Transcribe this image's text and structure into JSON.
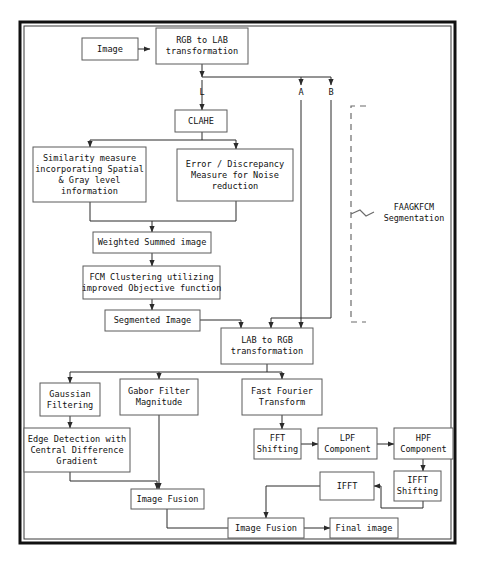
{
  "diagram": {
    "colors": {
      "box_stroke": "#5b5b5b",
      "edge": "#2b2b2b",
      "frame": "#111111",
      "bracket": "#6b6b6b",
      "background": "#ffffff"
    },
    "frame": {
      "x": 20,
      "y": 22,
      "w": 435,
      "h": 521
    },
    "nodes": [
      {
        "id": "image",
        "label": "Image",
        "lines": [
          "Image"
        ],
        "x": 82,
        "y": 38,
        "w": 56,
        "h": 22
      },
      {
        "id": "rgb2lab",
        "label": "RGB to LAB transformation",
        "lines": [
          "RGB to LAB",
          "transformation"
        ],
        "x": 156,
        "y": 28,
        "w": 92,
        "h": 36
      },
      {
        "id": "clahe",
        "label": "CLAHE",
        "lines": [
          "CLAHE"
        ],
        "x": 175,
        "y": 110,
        "w": 52,
        "h": 22
      },
      {
        "id": "similarity",
        "label": "Similarity measure incorporating Spatial & Gray level information",
        "lines": [
          "Similarity measure",
          "incorporating Spatial",
          "& Gray level",
          "information"
        ],
        "x": 33,
        "y": 147,
        "w": 113,
        "h": 55
      },
      {
        "id": "error",
        "label": "Error / Discrepancy Measure for Noise reduction",
        "lines": [
          "Error / Discrepancy",
          "Measure for Noise",
          "reduction"
        ],
        "x": 177,
        "y": 149,
        "w": 116,
        "h": 52
      },
      {
        "id": "weighted",
        "label": "Weighted Summed image",
        "lines": [
          "Weighted Summed image"
        ],
        "x": 93,
        "y": 232,
        "w": 118,
        "h": 21
      },
      {
        "id": "fcm",
        "label": "FCM Clustering utilizing improved Objective function",
        "lines": [
          "FCM Clustering utilizing",
          "improved Objective function"
        ],
        "x": 83,
        "y": 266,
        "w": 137,
        "h": 33
      },
      {
        "id": "segmented",
        "label": "Segmented Image",
        "lines": [
          "Segmented Image"
        ],
        "x": 105,
        "y": 310,
        "w": 95,
        "h": 21
      },
      {
        "id": "lab2rgb",
        "label": "LAB to RGB transformation",
        "lines": [
          "LAB to RGB",
          "transformation"
        ],
        "x": 221,
        "y": 328,
        "w": 92,
        "h": 36
      },
      {
        "id": "gaussian",
        "label": "Gaussian Filtering",
        "lines": [
          "Gaussian",
          "Filtering"
        ],
        "x": 40,
        "y": 383,
        "w": 60,
        "h": 33
      },
      {
        "id": "gabor",
        "label": "Gabor Filter Magnitude",
        "lines": [
          "Gabor Filter",
          "Magnitude"
        ],
        "x": 120,
        "y": 379,
        "w": 78,
        "h": 36
      },
      {
        "id": "fft",
        "label": "Fast Fourier Transform",
        "lines": [
          "Fast Fourier",
          "Transform"
        ],
        "x": 242,
        "y": 379,
        "w": 80,
        "h": 36
      },
      {
        "id": "edge",
        "label": "Edge Detection with Central Difference Gradient",
        "lines": [
          "Edge Detection with",
          "Central Difference",
          "Gradient"
        ],
        "x": 24,
        "y": 428,
        "w": 106,
        "h": 44
      },
      {
        "id": "fftshift",
        "label": "FFT Shifting",
        "lines": [
          "FFT",
          "Shifting"
        ],
        "x": 254,
        "y": 429,
        "w": 47,
        "h": 30
      },
      {
        "id": "lpf",
        "label": "LPF Component",
        "lines": [
          "LPF",
          "Component"
        ],
        "x": 318,
        "y": 428,
        "w": 59,
        "h": 31
      },
      {
        "id": "hpf",
        "label": "HPF Component",
        "lines": [
          "HPF",
          "Component"
        ],
        "x": 394,
        "y": 428,
        "w": 59,
        "h": 31
      },
      {
        "id": "ifftshift",
        "label": "IFFT Shifting",
        "lines": [
          "IFFT",
          "Shifting"
        ],
        "x": 394,
        "y": 471,
        "w": 47,
        "h": 30
      },
      {
        "id": "ifft",
        "label": "IFFT",
        "lines": [
          "IFFT"
        ],
        "x": 320,
        "y": 472,
        "w": 54,
        "h": 28
      },
      {
        "id": "fusion1",
        "label": "Image Fusion",
        "lines": [
          "Image Fusion"
        ],
        "x": 131,
        "y": 489,
        "w": 73,
        "h": 20
      },
      {
        "id": "fusion2",
        "label": "Image Fusion",
        "lines": [
          "Image Fusion"
        ],
        "x": 228,
        "y": 518,
        "w": 76,
        "h": 20
      },
      {
        "id": "final",
        "label": "Final image",
        "lines": [
          "Final image"
        ],
        "x": 330,
        "y": 518,
        "w": 68,
        "h": 20
      }
    ],
    "edge_labels": [
      {
        "id": "label-L",
        "text": "L",
        "x": 202,
        "y": 95
      },
      {
        "id": "label-A",
        "text": "A",
        "x": 301,
        "y": 95
      },
      {
        "id": "label-B",
        "text": "B",
        "x": 331,
        "y": 95
      }
    ],
    "edges": [
      {
        "id": "image-to-rgb2lab",
        "from": "image",
        "to": "rgb2lab",
        "path": "M138,49 L150,49",
        "arrow": true
      },
      {
        "id": "rgb2lab-to-split",
        "from": "rgb2lab",
        "to": "split-bus",
        "path": "M202,64 L202,77",
        "arrow": true
      },
      {
        "id": "split-bus",
        "from": "rgb2lab",
        "to": "ab-bus",
        "path": "M202,77 L331,77",
        "arrow": false
      },
      {
        "id": "bus-to-A",
        "from": "rgb2lab",
        "to": "A",
        "path": "M301,77 L301,85",
        "arrow": true
      },
      {
        "id": "bus-to-B",
        "from": "rgb2lab",
        "to": "B",
        "path": "M331,77 L331,85",
        "arrow": true
      },
      {
        "id": "L-to-clahe",
        "from": "rgb2lab",
        "to": "clahe",
        "path": "M202,80 L202,110",
        "arrow": true
      },
      {
        "id": "clahe-to-branch",
        "from": "clahe",
        "to": "branch",
        "path": "M202,132 L202,140 M90,140 L236,140",
        "arrow": false
      },
      {
        "id": "branch-to-similarity",
        "from": "clahe",
        "to": "similarity",
        "path": "M90,140 L90,147",
        "arrow": true
      },
      {
        "id": "branch-to-error",
        "from": "clahe",
        "to": "error",
        "path": "M236,140 L236,149",
        "arrow": true
      },
      {
        "id": "similarity-to-merge",
        "from": "similarity",
        "to": "weighted",
        "path": "M90,202 L90,221 L152,221",
        "arrow": false
      },
      {
        "id": "error-to-merge",
        "from": "error",
        "to": "weighted",
        "path": "M236,201 L236,221 L152,221",
        "arrow": false
      },
      {
        "id": "merge-to-weighted",
        "from": "merge",
        "to": "weighted",
        "path": "M152,221 L152,232",
        "arrow": true
      },
      {
        "id": "weighted-to-fcm",
        "from": "weighted",
        "to": "fcm",
        "path": "M152,253 L152,266",
        "arrow": true
      },
      {
        "id": "fcm-to-segmented",
        "from": "fcm",
        "to": "segmented",
        "path": "M152,299 L152,310",
        "arrow": true
      },
      {
        "id": "segmented-to-lab2rgb",
        "from": "segmented",
        "to": "lab2rgb",
        "path": "M200,320 L241,320 L241,328",
        "arrow": true
      },
      {
        "id": "A-to-lab2rgb",
        "from": "A",
        "to": "lab2rgb",
        "path": "M301,100 L301,328",
        "arrow": true
      },
      {
        "id": "B-to-lab2rgb",
        "from": "B",
        "to": "lab2rgb",
        "path": "M331,100 L331,318 L271,318 L271,328",
        "arrow": true
      },
      {
        "id": "lab2rgb-to-bus",
        "from": "lab2rgb",
        "to": "bus2",
        "path": "M267,364 L267,372 M70,372 L282,372",
        "arrow": false
      },
      {
        "id": "bus2-to-gaussian",
        "from": "lab2rgb",
        "to": "gaussian",
        "path": "M70,372 L70,383",
        "arrow": true
      },
      {
        "id": "bus2-to-gabor",
        "from": "lab2rgb",
        "to": "gabor",
        "path": "M159,372 L159,379",
        "arrow": true
      },
      {
        "id": "bus2-to-fft",
        "from": "lab2rgb",
        "to": "fft",
        "path": "M282,372 L282,379",
        "arrow": true
      },
      {
        "id": "gaussian-to-edge",
        "from": "gaussian",
        "to": "edge",
        "path": "M70,416 L70,428",
        "arrow": true
      },
      {
        "id": "edge-to-fusion1",
        "from": "edge",
        "to": "fusion1",
        "path": "M70,472 L70,481 L157,481",
        "arrow": false
      },
      {
        "id": "edge-arrow-fusion1",
        "from": "edge",
        "to": "fusion1",
        "path": "M157,481 L157,489",
        "arrow": true
      },
      {
        "id": "gabor-to-fusion1",
        "from": "gabor",
        "to": "fusion1",
        "path": "M159,415 L159,489",
        "arrow": true
      },
      {
        "id": "fft-to-fftshift",
        "from": "fft",
        "to": "fftshift",
        "path": "M282,415 L282,429",
        "arrow": true
      },
      {
        "id": "fftshift-to-lpf",
        "from": "fftshift",
        "to": "lpf",
        "path": "M301,444 L318,444",
        "arrow": true
      },
      {
        "id": "lpf-to-hpf",
        "from": "lpf",
        "to": "hpf",
        "path": "M377,444 L394,444",
        "arrow": true
      },
      {
        "id": "hpf-to-ifftshift",
        "from": "hpf",
        "to": "ifftshift",
        "path": "M423,459 L423,471",
        "arrow": true
      },
      {
        "id": "ifftshift-to-ifft",
        "from": "ifftshift",
        "to": "ifft",
        "path": "M423,501 L423,508 L381,508 L381,486",
        "arrow": false
      },
      {
        "id": "ifftshift-arrow-ifft",
        "from": "ifftshift",
        "to": "ifft",
        "path": "M381,486 L374,486",
        "arrow": true
      },
      {
        "id": "ifft-to-fusion2",
        "from": "ifft",
        "to": "fusion2",
        "path": "M320,486 L266,486 L266,518",
        "arrow": true
      },
      {
        "id": "fusion1-to-fusion2",
        "from": "fusion1",
        "to": "fusion2",
        "path": "M167,509 L167,528 L266,528",
        "arrow": false
      },
      {
        "id": "fusion2-to-final",
        "from": "fusion2",
        "to": "final",
        "path": "M304,528 L330,528",
        "arrow": true
      }
    ],
    "bracket": {
      "id": "faagkfcm-bracket",
      "path": "M366,106 L351,106 L351,322 L366,322",
      "tick": "M351,214 L360,210 L366,216 L374,212",
      "label_lines": [
        "FAAGKFCM",
        "Segmentation"
      ],
      "label_x": 414,
      "label_y": 210
    }
  }
}
